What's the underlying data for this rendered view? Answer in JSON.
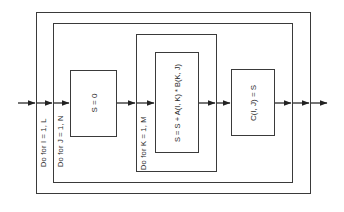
{
  "diagram": {
    "type": "nested-loop flowchart (matrix multiplication)",
    "loops": [
      {
        "id": "loop-i",
        "label": "Do for I = 1, L"
      },
      {
        "id": "loop-j",
        "label": "Do for J = 1, N"
      },
      {
        "id": "loop-k",
        "label": "Do for K = 1, M"
      }
    ],
    "statements": [
      {
        "id": "init-s",
        "text": "S = 0"
      },
      {
        "id": "accumulate",
        "text": "S = S + A(I, K) * B(K, J)"
      },
      {
        "id": "store-c",
        "text": "C(I, J) = S"
      }
    ],
    "colors": {
      "line": "#3a3a3a",
      "text": "#2a2a2a",
      "background": "#ffffff"
    }
  }
}
